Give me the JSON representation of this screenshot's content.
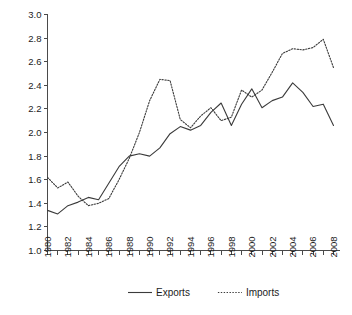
{
  "chart_data": {
    "type": "line",
    "title": "",
    "subtitle": "",
    "xlabel": "",
    "ylabel": "",
    "xlim": [
      1980,
      2008
    ],
    "ylim": [
      1.0,
      3.0
    ],
    "grid": false,
    "legend_position": "bottom",
    "x": [
      1980,
      1981,
      1982,
      1983,
      1984,
      1985,
      1986,
      1987,
      1988,
      1989,
      1990,
      1991,
      1992,
      1993,
      1994,
      1995,
      1996,
      1997,
      1998,
      1999,
      2000,
      2001,
      2002,
      2003,
      2004,
      2005,
      2006,
      2007,
      2008
    ],
    "x_tick_labels": [
      "1980",
      "1982",
      "1984",
      "1986",
      "1988",
      "1990",
      "1992",
      "1994",
      "1996",
      "1998",
      "2000",
      "2002",
      "2004",
      "2006",
      "2008"
    ],
    "y_tick_labels": [
      "1.0",
      "1.2",
      "1.4",
      "1.6",
      "1.8",
      "2.0",
      "2.2",
      "2.4",
      "2.6",
      "2.8",
      "3.0"
    ],
    "y_ticks": [
      1.0,
      1.2,
      1.4,
      1.6,
      1.8,
      2.0,
      2.2,
      2.4,
      2.6,
      2.8,
      3.0
    ],
    "series": [
      {
        "name": "Exports",
        "style": "solid",
        "color": "#3b3b3b",
        "values": [
          1.34,
          1.31,
          1.38,
          1.41,
          1.45,
          1.43,
          1.57,
          1.71,
          1.8,
          1.82,
          1.8,
          1.87,
          1.99,
          2.05,
          2.02,
          2.06,
          2.17,
          2.25,
          2.06,
          2.24,
          2.37,
          2.21,
          2.27,
          2.3,
          2.42,
          2.34,
          2.22,
          2.24,
          2.06
        ]
      },
      {
        "name": "Imports",
        "style": "dotted",
        "color": "#3b3b3b",
        "values": [
          1.62,
          1.53,
          1.58,
          1.46,
          1.38,
          1.4,
          1.44,
          1.6,
          1.78,
          2.0,
          2.27,
          2.45,
          2.44,
          2.11,
          2.04,
          2.14,
          2.21,
          2.1,
          2.13,
          2.36,
          2.3,
          2.36,
          2.51,
          2.67,
          2.71,
          2.7,
          2.72,
          2.79,
          2.55
        ]
      }
    ]
  },
  "legend": {
    "items": [
      {
        "label": "Exports",
        "style": "solid"
      },
      {
        "label": "Imports",
        "style": "dotted"
      }
    ]
  }
}
